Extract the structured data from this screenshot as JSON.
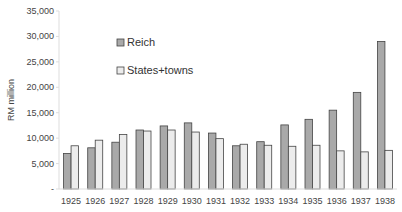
{
  "chart_data": {
    "type": "bar",
    "title": "",
    "xlabel": "",
    "ylabel": "RM million",
    "ylim": [
      0,
      35000
    ],
    "yticks": [
      "-",
      "5,000",
      "10,000",
      "15,000",
      "20,000",
      "25,000",
      "30,000",
      "35,000"
    ],
    "grid": false,
    "legend_position": "upper-left-inside",
    "categories": [
      "1925",
      "1926",
      "1927",
      "1928",
      "1929",
      "1930",
      "1931",
      "1932",
      "1933",
      "1934",
      "1935",
      "1936",
      "1937",
      "1938"
    ],
    "series": [
      {
        "name": "Reich",
        "color": "#a9a9a9",
        "values": [
          7000,
          8100,
          9200,
          11600,
          12400,
          13000,
          11000,
          8500,
          9300,
          12600,
          13700,
          15500,
          19000,
          29000
        ]
      },
      {
        "name": "States+towns",
        "color": "#ececec",
        "values": [
          8500,
          9600,
          10700,
          11400,
          11600,
          11200,
          9900,
          8800,
          8600,
          8400,
          8600,
          7500,
          7300,
          7600
        ]
      }
    ]
  }
}
